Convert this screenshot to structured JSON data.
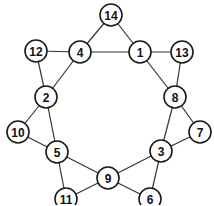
{
  "diagram": {
    "type": "graph",
    "colors": {
      "edge": "#333333",
      "node_stroke": "#1a1a1a",
      "node_fill": "#ffffff",
      "label": "#111111"
    },
    "node_radius": 11,
    "nodes": [
      {
        "id": "14",
        "label": "14",
        "x": 111,
        "y": 15
      },
      {
        "id": "4",
        "label": "4",
        "x": 80,
        "y": 52
      },
      {
        "id": "1",
        "label": "1",
        "x": 140,
        "y": 52
      },
      {
        "id": "12",
        "label": "12",
        "x": 36,
        "y": 51
      },
      {
        "id": "13",
        "label": "13",
        "x": 182,
        "y": 52
      },
      {
        "id": "2",
        "label": "2",
        "x": 46,
        "y": 97
      },
      {
        "id": "8",
        "label": "8",
        "x": 175,
        "y": 97
      },
      {
        "id": "10",
        "label": "10",
        "x": 18,
        "y": 132
      },
      {
        "id": "7",
        "label": "7",
        "x": 200,
        "y": 132
      },
      {
        "id": "5",
        "label": "5",
        "x": 57,
        "y": 152
      },
      {
        "id": "3",
        "label": "3",
        "x": 161,
        "y": 151
      },
      {
        "id": "9",
        "label": "9",
        "x": 108,
        "y": 178
      },
      {
        "id": "11",
        "label": "11",
        "x": 66,
        "y": 199
      },
      {
        "id": "6",
        "label": "6",
        "x": 150,
        "y": 199
      }
    ],
    "edges": [
      [
        "14",
        "4"
      ],
      [
        "14",
        "1"
      ],
      [
        "4",
        "1"
      ],
      [
        "12",
        "4"
      ],
      [
        "1",
        "13"
      ],
      [
        "12",
        "2"
      ],
      [
        "4",
        "2"
      ],
      [
        "1",
        "8"
      ],
      [
        "13",
        "8"
      ],
      [
        "2",
        "10"
      ],
      [
        "2",
        "5"
      ],
      [
        "10",
        "5"
      ],
      [
        "8",
        "7"
      ],
      [
        "8",
        "3"
      ],
      [
        "7",
        "3"
      ],
      [
        "5",
        "9"
      ],
      [
        "5",
        "11"
      ],
      [
        "11",
        "9"
      ],
      [
        "3",
        "9"
      ],
      [
        "3",
        "6"
      ],
      [
        "9",
        "6"
      ]
    ]
  }
}
